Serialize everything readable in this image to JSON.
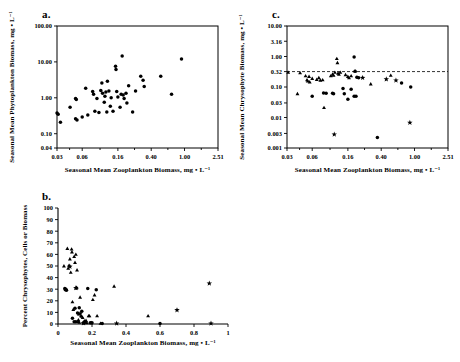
{
  "figure": {
    "background": "#ffffff",
    "ink": "#000000",
    "panels": [
      "a.",
      "b.",
      "c."
    ]
  },
  "chart_data": [
    {
      "panel": "a.",
      "type": "scatter",
      "title": "a.",
      "xlabel": "Seasonal Mean Zooplankton Biomass,  mg • L⁻¹",
      "ylabel": "Seasonal Mean Phytoplankton Biomass,  mg • L⁻¹",
      "xscale": "log",
      "yscale": "log",
      "xlim": [
        0.03,
        2.51
      ],
      "ylim": [
        0.04,
        100.0
      ],
      "xticks": [
        0.03,
        0.06,
        0.16,
        0.4,
        1.0,
        2.51
      ],
      "xticklabels": [
        "0.03",
        "0.06",
        "0.16",
        "0.40",
        "1.00",
        "2.51"
      ],
      "yticks": [
        0.04,
        0.1,
        1.0,
        10.0,
        100.0
      ],
      "yticklabels": [
        "0.04",
        "0.10",
        "1.00",
        "10.00",
        "100.00"
      ],
      "grid": false,
      "legend": null,
      "series": [
        {
          "name": "lakes",
          "marker": "circle",
          "points": [
            [
              0.03,
              0.38
            ],
            [
              0.031,
              0.35
            ],
            [
              0.033,
              0.21
            ],
            [
              0.043,
              0.55
            ],
            [
              0.05,
              0.95
            ],
            [
              0.051,
              0.9
            ],
            [
              0.05,
              0.26
            ],
            [
              0.052,
              0.24
            ],
            [
              0.06,
              0.29
            ],
            [
              0.066,
              1.85
            ],
            [
              0.07,
              0.33
            ],
            [
              0.08,
              1.5
            ],
            [
              0.082,
              1.25
            ],
            [
              0.085,
              0.42
            ],
            [
              0.09,
              0.95
            ],
            [
              0.095,
              0.39
            ],
            [
              0.1,
              1.6
            ],
            [
              0.103,
              2.6
            ],
            [
              0.105,
              1.35
            ],
            [
              0.11,
              0.75
            ],
            [
              0.112,
              1.1
            ],
            [
              0.115,
              1.45
            ],
            [
              0.118,
              0.4
            ],
            [
              0.12,
              2.9
            ],
            [
              0.125,
              1.55
            ],
            [
              0.13,
              0.58
            ],
            [
              0.133,
              1.0
            ],
            [
              0.14,
              0.42
            ],
            [
              0.15,
              7.6
            ],
            [
              0.152,
              6.1
            ],
            [
              0.155,
              1.5
            ],
            [
              0.16,
              1.05
            ],
            [
              0.17,
              0.55
            ],
            [
              0.175,
              1.25
            ],
            [
              0.18,
              14.5
            ],
            [
              0.185,
              1.2
            ],
            [
              0.19,
              0.95
            ],
            [
              0.2,
              1.35
            ],
            [
              0.205,
              0.72
            ],
            [
              0.215,
              2.15
            ],
            [
              0.24,
              0.4
            ],
            [
              0.26,
              1.55
            ],
            [
              0.3,
              4.0
            ],
            [
              0.32,
              3.1
            ],
            [
              0.33,
              2.05
            ],
            [
              0.52,
              4.0
            ],
            [
              0.7,
              1.25
            ],
            [
              0.92,
              12.0
            ]
          ]
        }
      ]
    },
    {
      "panel": "b.",
      "type": "scatter",
      "title": "b.",
      "xlabel": "Seasonal Mean Zooplankton Biomass,  mg • L⁻¹",
      "ylabel": "Percent Chrysophytes, Cells or Biomass",
      "xscale": "linear",
      "yscale": "linear",
      "xlim": [
        0,
        1
      ],
      "ylim": [
        0,
        100
      ],
      "xticks": [
        0,
        0.2,
        0.4,
        0.6,
        0.8,
        1
      ],
      "xticklabels": [
        "0",
        "0.2",
        "0.4",
        "0.6",
        "0.8",
        "1"
      ],
      "yticks": [
        0,
        10,
        20,
        30,
        40,
        50,
        60,
        70,
        80,
        90,
        100
      ],
      "yticklabels": [
        "0",
        "10",
        "20",
        "30",
        "40",
        "50",
        "60",
        "70",
        "80",
        "90",
        "100"
      ],
      "grid": false,
      "legend": null,
      "series": [
        {
          "name": "triangles",
          "marker": "triangle",
          "points": [
            [
              0.035,
              50.0
            ],
            [
              0.055,
              65.0
            ],
            [
              0.06,
              48.0
            ],
            [
              0.065,
              50.5
            ],
            [
              0.07,
              56.0
            ],
            [
              0.075,
              44.5
            ],
            [
              0.08,
              64.5
            ],
            [
              0.082,
              62.0
            ],
            [
              0.085,
              19.0
            ],
            [
              0.09,
              12.5
            ],
            [
              0.095,
              58.0
            ],
            [
              0.1,
              53.0
            ],
            [
              0.105,
              60.0
            ],
            [
              0.108,
              31.0
            ],
            [
              0.11,
              31.5
            ],
            [
              0.112,
              46.5
            ],
            [
              0.118,
              2.0
            ],
            [
              0.12,
              3.5
            ],
            [
              0.122,
              8.5
            ],
            [
              0.125,
              1.5
            ],
            [
              0.13,
              23.0
            ],
            [
              0.135,
              7.0
            ],
            [
              0.14,
              6.5
            ],
            [
              0.145,
              5.5
            ],
            [
              0.15,
              1.0
            ],
            [
              0.155,
              2.5
            ],
            [
              0.16,
              1.5
            ],
            [
              0.165,
              3.0
            ],
            [
              0.17,
              1.0
            ],
            [
              0.18,
              7.0
            ],
            [
              0.185,
              7.0
            ],
            [
              0.195,
              1.0
            ],
            [
              0.205,
              21.0
            ],
            [
              0.215,
              25.0
            ],
            [
              0.23,
              7.0
            ],
            [
              0.25,
              0.5
            ],
            [
              0.33,
              32.5
            ],
            [
              0.53,
              7.0
            ]
          ]
        },
        {
          "name": "circles",
          "marker": "circle",
          "points": [
            [
              0.04,
              30.5
            ],
            [
              0.043,
              29.5
            ],
            [
              0.046,
              30.0
            ],
            [
              0.05,
              29.0
            ],
            [
              0.085,
              5.0
            ],
            [
              0.095,
              2.0
            ],
            [
              0.1,
              13.5
            ],
            [
              0.105,
              2.0
            ],
            [
              0.115,
              9.5
            ],
            [
              0.125,
              14.0
            ],
            [
              0.14,
              11.0
            ],
            [
              0.15,
              1.0
            ],
            [
              0.175,
              30.5
            ],
            [
              0.19,
              1.0
            ],
            [
              0.2,
              1.0
            ],
            [
              0.225,
              29.5
            ],
            [
              0.26,
              0.5
            ],
            [
              0.6,
              0.5
            ]
          ]
        },
        {
          "name": "stars",
          "marker": "star",
          "points": [
            [
              0.07,
              49.5
            ],
            [
              0.105,
              31.0
            ],
            [
              0.13,
              9.0
            ],
            [
              0.15,
              0.8
            ],
            [
              0.345,
              0.5
            ],
            [
              0.7,
              12.0
            ],
            [
              0.89,
              35.0
            ],
            [
              0.9,
              0.5
            ]
          ]
        }
      ]
    },
    {
      "panel": "c.",
      "type": "scatter",
      "title": "c.",
      "xlabel": "Seasonal Mean Zooplankton Biomass,  mg • L⁻¹",
      "ylabel": "Seasonal Mean Chrysophyte Biomass,  mg • L⁻¹",
      "xscale": "log",
      "yscale": "log",
      "xlim": [
        0.03,
        2.51
      ],
      "ylim": [
        0.001,
        10.0
      ],
      "xticks": [
        0.03,
        0.06,
        0.16,
        0.4,
        1.0,
        2.51
      ],
      "xticklabels": [
        "0.03",
        "0.06",
        "0.16",
        "0.40",
        "1.00",
        "2.51"
      ],
      "yticks": [
        0.001,
        0.003,
        0.01,
        0.03,
        0.1,
        0.32,
        1.0,
        3.16,
        10.0
      ],
      "yticklabels": [
        "0.001",
        "0.003",
        "0.01",
        "0.03",
        "0.10",
        "0.32",
        "1.00",
        "3.16",
        "10.00"
      ],
      "grid": false,
      "legend": null,
      "reference_line": {
        "orientation": "horizontal",
        "value": 0.32,
        "style": "dashed"
      },
      "series": [
        {
          "name": "triangles",
          "marker": "triangle",
          "points": [
            [
              0.031,
              0.3
            ],
            [
              0.04,
              0.06
            ],
            [
              0.043,
              0.29
            ],
            [
              0.05,
              0.23
            ],
            [
              0.052,
              0.17
            ],
            [
              0.053,
              0.155
            ],
            [
              0.055,
              0.22
            ],
            [
              0.056,
              0.145
            ],
            [
              0.06,
              0.19
            ],
            [
              0.068,
              0.175
            ],
            [
              0.072,
              0.2
            ],
            [
              0.075,
              0.165
            ],
            [
              0.08,
              0.17
            ],
            [
              0.083,
              0.021
            ],
            [
              0.1,
              0.23
            ],
            [
              0.105,
              0.26
            ],
            [
              0.108,
              0.24
            ],
            [
              0.112,
              0.3
            ],
            [
              0.118,
              0.85
            ],
            [
              0.12,
              0.62
            ],
            [
              0.122,
              0.28
            ],
            [
              0.125,
              0.26
            ],
            [
              0.13,
              0.3
            ],
            [
              0.15,
              0.25
            ],
            [
              0.16,
              0.22
            ],
            [
              0.165,
              0.2
            ],
            [
              0.175,
              0.23
            ],
            [
              0.195,
              0.33
            ],
            [
              0.3,
              0.125
            ],
            [
              0.52,
              0.24
            ]
          ]
        },
        {
          "name": "circles",
          "marker": "circle",
          "points": [
            [
              0.06,
              0.05
            ],
            [
              0.082,
              0.063
            ],
            [
              0.088,
              0.062
            ],
            [
              0.105,
              0.062
            ],
            [
              0.108,
              0.06
            ],
            [
              0.14,
              0.09
            ],
            [
              0.145,
              0.06
            ],
            [
              0.16,
              0.04
            ],
            [
              0.175,
              0.085
            ],
            [
              0.19,
              0.05
            ],
            [
              0.2,
              0.05
            ],
            [
              0.19,
              0.97
            ],
            [
              0.195,
              0.33
            ],
            [
              0.205,
              0.21
            ],
            [
              0.215,
              0.2
            ],
            [
              0.7,
              0.135
            ],
            [
              0.9,
              0.1
            ],
            [
              0.36,
              0.0022
            ]
          ]
        },
        {
          "name": "stars",
          "marker": "star",
          "points": [
            [
              0.11,
              0.0028
            ],
            [
              0.24,
              0.2
            ],
            [
              0.46,
              0.18
            ],
            [
              0.6,
              0.165
            ],
            [
              0.88,
              0.0068
            ]
          ]
        }
      ]
    }
  ]
}
